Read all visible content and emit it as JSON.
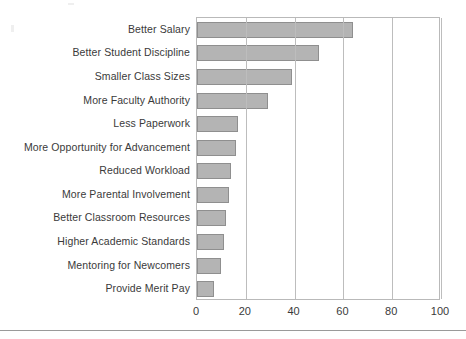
{
  "chart_data": {
    "type": "bar",
    "orientation": "horizontal",
    "title": "",
    "subtitle": "",
    "xlabel": "",
    "ylabel": "",
    "categories": [
      "Better Salary",
      "Better Student Discipline",
      "Smaller Class Sizes",
      "More Faculty Authority",
      "Less Paperwork",
      "More Opportunity for Advancement",
      "Reduced Workload",
      "More Parental Involvement",
      "Better Classroom Resources",
      "Higher Academic Standards",
      "Mentoring for Newcomers",
      "Provide Merit Pay"
    ],
    "values": [
      64,
      50,
      39,
      29,
      17,
      16,
      14,
      13,
      12,
      11,
      10,
      7
    ],
    "xlim": [
      0,
      100
    ],
    "xticks": [
      0,
      20,
      40,
      60,
      80,
      100
    ],
    "xtick_labels": [
      "0",
      "20",
      "40",
      "60",
      "80",
      "100"
    ],
    "grid": "vertical",
    "legend": "none",
    "bar_fill": "#b4b4b4",
    "bar_edge": "#8f8f8f",
    "axis_color": "#b9b9b9",
    "gridline_color": "#bdbdbd",
    "text_color": "#3a3a3a"
  }
}
